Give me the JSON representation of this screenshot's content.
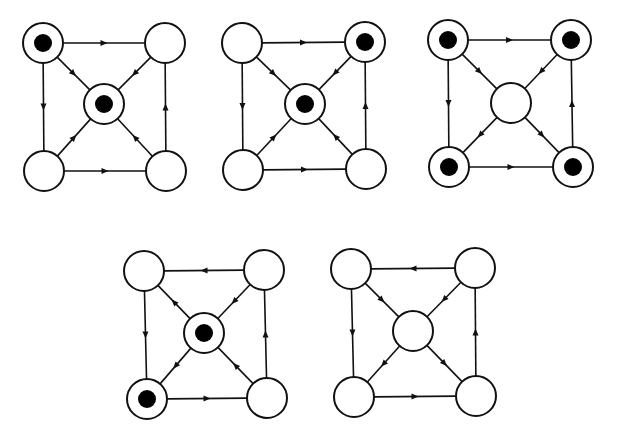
{
  "figure": {
    "node_radius": 20,
    "dot_radius": 9,
    "colors": {
      "stroke": "#111111",
      "fill": "#ffffff",
      "dot": "#000000"
    }
  },
  "diagrams": [
    {
      "id": "diagram-1",
      "nodes": {
        "TL": {
          "x": 43,
          "y": 43,
          "filled": true
        },
        "TR": {
          "x": 165,
          "y": 43,
          "filled": false
        },
        "C": {
          "x": 104,
          "y": 104,
          "filled": true
        },
        "BL": {
          "x": 44,
          "y": 171,
          "filled": false
        },
        "BR": {
          "x": 166,
          "y": 171,
          "filled": false
        }
      },
      "edges": [
        [
          "TL",
          "TR"
        ],
        [
          "TL",
          "BL"
        ],
        [
          "BL",
          "BR"
        ],
        [
          "BR",
          "TR"
        ],
        [
          "TL",
          "C"
        ],
        [
          "TR",
          "C"
        ],
        [
          "BL",
          "C"
        ],
        [
          "BR",
          "C"
        ]
      ]
    },
    {
      "id": "diagram-2",
      "nodes": {
        "TL": {
          "x": 242,
          "y": 43,
          "filled": false
        },
        "TR": {
          "x": 365,
          "y": 42,
          "filled": true
        },
        "C": {
          "x": 305,
          "y": 104,
          "filled": true
        },
        "BL": {
          "x": 243,
          "y": 170,
          "filled": false
        },
        "BR": {
          "x": 366,
          "y": 169,
          "filled": false
        }
      },
      "edges": [
        [
          "TL",
          "TR"
        ],
        [
          "TL",
          "BL"
        ],
        [
          "BL",
          "BR"
        ],
        [
          "BR",
          "TR"
        ],
        [
          "TL",
          "C"
        ],
        [
          "TR",
          "C"
        ],
        [
          "BL",
          "C"
        ],
        [
          "BR",
          "C"
        ]
      ]
    },
    {
      "id": "diagram-3",
      "nodes": {
        "TL": {
          "x": 448,
          "y": 40,
          "filled": true
        },
        "TR": {
          "x": 571,
          "y": 40,
          "filled": true
        },
        "C": {
          "x": 511,
          "y": 103,
          "filled": false
        },
        "BL": {
          "x": 449,
          "y": 167,
          "filled": true
        },
        "BR": {
          "x": 573,
          "y": 167,
          "filled": true
        }
      },
      "edges": [
        [
          "TL",
          "TR"
        ],
        [
          "TL",
          "BL"
        ],
        [
          "BL",
          "BR"
        ],
        [
          "BR",
          "TR"
        ],
        [
          "TL",
          "C"
        ],
        [
          "TR",
          "C"
        ],
        [
          "C",
          "BL"
        ],
        [
          "C",
          "BR"
        ]
      ]
    },
    {
      "id": "diagram-4",
      "nodes": {
        "TL": {
          "x": 144,
          "y": 271,
          "filled": false
        },
        "TR": {
          "x": 264,
          "y": 270,
          "filled": false
        },
        "C": {
          "x": 204,
          "y": 333,
          "filled": true
        },
        "BL": {
          "x": 147,
          "y": 399,
          "filled": true
        },
        "BR": {
          "x": 267,
          "y": 398,
          "filled": false
        }
      },
      "edges": [
        [
          "TR",
          "TL"
        ],
        [
          "TL",
          "BL"
        ],
        [
          "BL",
          "BR"
        ],
        [
          "BR",
          "TR"
        ],
        [
          "C",
          "TL"
        ],
        [
          "TR",
          "C"
        ],
        [
          "C",
          "BL"
        ],
        [
          "BR",
          "C"
        ]
      ]
    },
    {
      "id": "diagram-5",
      "nodes": {
        "TL": {
          "x": 351,
          "y": 269,
          "filled": false
        },
        "TR": {
          "x": 475,
          "y": 268,
          "filled": false
        },
        "C": {
          "x": 413,
          "y": 331,
          "filled": false
        },
        "BL": {
          "x": 354,
          "y": 397,
          "filled": false
        },
        "BR": {
          "x": 476,
          "y": 396,
          "filled": false
        }
      },
      "edges": [
        [
          "TR",
          "TL"
        ],
        [
          "TL",
          "BL"
        ],
        [
          "BL",
          "BR"
        ],
        [
          "BR",
          "TR"
        ],
        [
          "TL",
          "C"
        ],
        [
          "TR",
          "C"
        ],
        [
          "C",
          "BL"
        ],
        [
          "C",
          "BR"
        ]
      ]
    }
  ]
}
